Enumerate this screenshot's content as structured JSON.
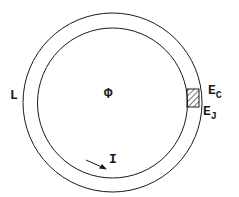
{
  "diagram": {
    "type": "superconducting ring with Josephson junction",
    "labels": {
      "inductance": "L",
      "flux": "Φ",
      "current": "I",
      "charging_energy": {
        "main": "E",
        "sub": "C"
      },
      "josephson_energy": {
        "main": "E",
        "sub": "J"
      }
    },
    "colors": {
      "line": "#1a1a1a",
      "background": "#ffffff"
    }
  }
}
